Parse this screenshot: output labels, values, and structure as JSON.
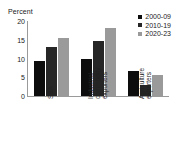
{
  "chart_data": {
    "type": "bar",
    "title": "",
    "subtitle": "",
    "xlabel": "",
    "ylabel": "Percent",
    "ylim": [
      0,
      20
    ],
    "yticks": [
      0,
      5,
      10,
      15,
      20
    ],
    "grid": false,
    "legend_position": "top-right",
    "categories": [
      "SSA",
      "Industrial-commodity exporters",
      "Agriculture exporters"
    ],
    "category_label_lines": [
      [
        "SSA"
      ],
      [
        "Industrial-",
        "commodity",
        "exporters"
      ],
      [
        "Agriculture",
        "exporters"
      ]
    ],
    "series": [
      {
        "name": "2000-09",
        "color": "#0d0d0d",
        "values": [
          9.3,
          10.0,
          6.6
        ]
      },
      {
        "name": "2010-19",
        "color": "#262626",
        "values": [
          13.2,
          14.8,
          3.0
        ]
      },
      {
        "name": "2020-23",
        "color": "#9a9a9a",
        "values": [
          15.6,
          18.1,
          5.7
        ]
      }
    ]
  },
  "axis": {
    "y_title": "Percent",
    "y_tick_labels": [
      "20",
      "15",
      "10",
      "5",
      "0"
    ]
  },
  "legend": {
    "items": [
      {
        "label": "2000-09",
        "color": "#0d0d0d"
      },
      {
        "label": "2010-19",
        "color": "#262626"
      },
      {
        "label": "2020-23",
        "color": "#9a9a9a"
      }
    ]
  },
  "colors": {
    "axis_line": "#9a9a9a",
    "text": "#1a1a1a",
    "background": "#ffffff"
  }
}
